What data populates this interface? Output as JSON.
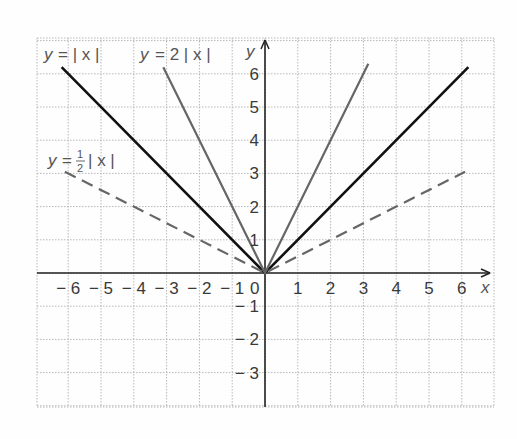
{
  "chart_data": {
    "type": "line",
    "title": "",
    "xlabel": "x",
    "ylabel": "y",
    "xlim": [
      -7,
      7
    ],
    "ylim": [
      -4,
      7
    ],
    "grid": true,
    "x_ticks": [
      "-6",
      "-5",
      "-4",
      "-3",
      "-2",
      "-1",
      "0",
      "1",
      "2",
      "3",
      "4",
      "5",
      "6"
    ],
    "y_ticks": [
      "-3",
      "-2",
      "-1",
      "1",
      "2",
      "3",
      "4",
      "5",
      "6"
    ],
    "series": [
      {
        "name": "y = |x|",
        "style": "solid",
        "color": "#111111",
        "x": [
          -6.2,
          0,
          6.2
        ],
        "y": [
          6.2,
          0,
          6.2
        ]
      },
      {
        "name": "y = 2|x|",
        "style": "solid",
        "color": "#666666",
        "x": [
          -3.1,
          0,
          3.15
        ],
        "y": [
          6.2,
          0,
          6.3
        ]
      },
      {
        "name": "y = 1/2|x|",
        "style": "dashed",
        "color": "#666666",
        "x": [
          -6.1,
          0,
          6.1
        ],
        "y": [
          3.05,
          0,
          3.05
        ]
      }
    ],
    "annotations": [
      {
        "text": "y = |x|",
        "near": [
          -6.5,
          6.6
        ]
      },
      {
        "text": "y = 2|x|",
        "near": [
          -3.8,
          6.6
        ]
      },
      {
        "text": "y = 1/2|x|",
        "near": [
          -6.5,
          3.7
        ]
      }
    ]
  },
  "labels": {
    "x_axis": "x",
    "y_axis": "y",
    "eq1_lhs": "y",
    "eq1_rhs": "= | x |",
    "eq2_lhs": "y",
    "eq2_rhs": "= 2 | x |",
    "eq3_lhs": "y",
    "eq3_eq": "=",
    "eq3_num": "1",
    "eq3_den": "2",
    "eq3_abs": "| x |"
  }
}
